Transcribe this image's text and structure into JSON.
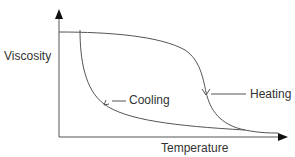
{
  "diagram": {
    "type": "hysteresis",
    "axes": {
      "y_label": "Viscosity",
      "x_label": "Temperature"
    },
    "curves": [
      {
        "name": "Heating",
        "label": "Heating",
        "direction": "left-to-right"
      },
      {
        "name": "Cooling",
        "label": "Cooling",
        "direction": "right-to-left"
      }
    ],
    "colors": {
      "line": "#555555",
      "axis": "#555555",
      "arrowhead": "#111111",
      "text": "#333333"
    }
  }
}
